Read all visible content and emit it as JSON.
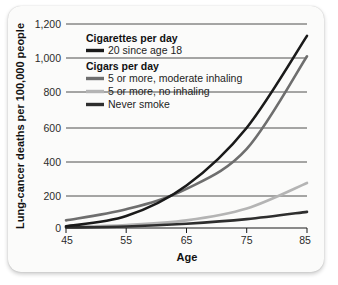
{
  "chart_data": {
    "type": "line",
    "title": "",
    "xlabel": "Age",
    "ylabel": "Lung-cancer deaths per 100,000 people",
    "xlim": [
      45,
      85
    ],
    "ylim": [
      0,
      1200
    ],
    "x": [
      45,
      55,
      65,
      75,
      85
    ],
    "xticks": [
      "45",
      "55",
      "65",
      "75",
      "85"
    ],
    "yticks": [
      "0",
      "200",
      "400",
      "600",
      "800",
      "1,000",
      "1,200"
    ],
    "ytick_values": [
      0,
      200,
      400,
      600,
      800,
      1000,
      1200
    ],
    "grid": "horizontal",
    "legend_position": "upper-left-inside",
    "series": [
      {
        "name": "20 since age 18",
        "group": "Cigarettes per day",
        "color": "#1a1a1a",
        "values": [
          10,
          70,
          250,
          590,
          1130
        ]
      },
      {
        "name": "5 or more, moderate inhaling",
        "group": "Cigars per day",
        "color": "#6e6e6e",
        "values": [
          45,
          110,
          230,
          465,
          1010
        ]
      },
      {
        "name": "5 or more, no inhaling",
        "group": "Cigars per day",
        "color": "#b4b4b4",
        "values": [
          8,
          18,
          45,
          115,
          265
        ]
      },
      {
        "name": "Never smoke",
        "group": "Cigars per day",
        "color": "#2e2e2e",
        "values": [
          3,
          9,
          25,
          52,
          95
        ]
      }
    ],
    "legend": {
      "groups": [
        {
          "heading": "Cigarettes per day",
          "entries": [
            {
              "label": "20 since age 18",
              "color": "#1a1a1a"
            }
          ]
        },
        {
          "heading": "Cigars per day",
          "entries": [
            {
              "label": "5 or more, moderate inhaling",
              "color": "#6e6e6e"
            },
            {
              "label": "5 or more, no inhaling",
              "color": "#b4b4b4"
            },
            {
              "label": "Never smoke",
              "color": "#2e2e2e"
            }
          ]
        }
      ]
    },
    "colors": {
      "background": "#fbfbfa",
      "gridline": "#3b3b3b",
      "axis": "#1a1a1a",
      "text": "#111111"
    }
  }
}
